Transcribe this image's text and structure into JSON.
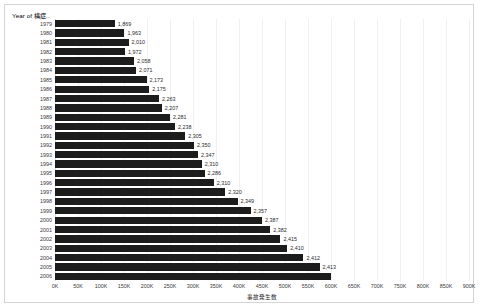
{
  "chart_data": {
    "type": "bar",
    "orientation": "horizontal",
    "title": "Year of 構症..",
    "xlabel": "事故発生数",
    "ylabel": "",
    "xlim": [
      0,
      900000
    ],
    "xticks": [
      "0K",
      "50K",
      "100K",
      "150K",
      "200K",
      "250K",
      "300K",
      "350K",
      "400K",
      "450K",
      "500K",
      "550K",
      "600K",
      "650K",
      "700K",
      "750K",
      "800K",
      "850K",
      "900K"
    ],
    "xtick_values": [
      0,
      50000,
      100000,
      150000,
      200000,
      250000,
      300000,
      350000,
      400000,
      450000,
      500000,
      550000,
      600000,
      650000,
      700000,
      750000,
      800000,
      850000,
      900000
    ],
    "grid": true,
    "legend": false,
    "categories": [
      "1979",
      "1980",
      "1981",
      "1982",
      "1983",
      "1984",
      "1985",
      "1986",
      "1987",
      "1988",
      "1989",
      "1990",
      "1991",
      "1992",
      "1993",
      "1994",
      "1995",
      "1996",
      "1997",
      "1998",
      "1999",
      "2000",
      "2001",
      "2002",
      "2003",
      "2004",
      "2005",
      "2006"
    ],
    "data_labels": [
      "1,869",
      "1,963",
      "2,010",
      "1,972",
      "2,058",
      "2,071",
      "2,173",
      "2,175",
      "2,263",
      "2,207",
      "2,281",
      "2,238",
      "2,305",
      "2,350",
      "2,347",
      "2,310",
      "2,286",
      "2,310",
      "2,320",
      "2,349",
      "2,357",
      "2,387",
      "2,382",
      "2,415",
      "2,410",
      "2,412",
      "2,413",
      ""
    ],
    "bar_values": [
      130000,
      151000,
      160000,
      152000,
      172000,
      176000,
      199000,
      205000,
      226000,
      232000,
      250000,
      261000,
      283000,
      302000,
      311000,
      319000,
      325000,
      345000,
      370000,
      397000,
      425000,
      450000,
      468000,
      490000,
      505000,
      540000,
      575000,
      600000
    ],
    "values": [
      1869,
      1963,
      2010,
      1972,
      2058,
      2071,
      2173,
      2175,
      2263,
      2207,
      2281,
      2238,
      2305,
      2350,
      2347,
      2310,
      2286,
      2310,
      2320,
      2349,
      2357,
      2387,
      2382,
      2415,
      2410,
      2412,
      2413,
      null
    ],
    "last_row_clipped": true
  },
  "colors": {
    "bar": "#1c1c1c",
    "grid": "#f0f0f0",
    "border": "#d4d4d4",
    "text": "#2b2b2b",
    "background": "#ffffff"
  }
}
